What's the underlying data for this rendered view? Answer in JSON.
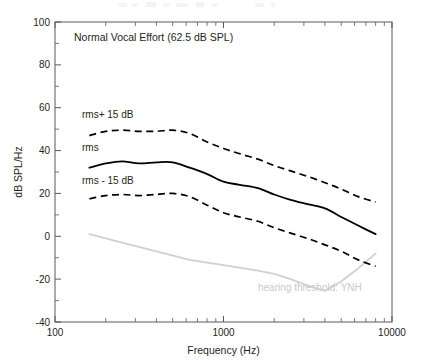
{
  "chart_data": {
    "type": "line",
    "title": "Normal Vocal Effort (62.5 dB SPL)",
    "xlabel": "Frequency (Hz)",
    "ylabel": "dB SPL/Hz",
    "xscale": "log",
    "xlim": [
      100,
      10000
    ],
    "ylim": [
      -40,
      100
    ],
    "xticks": [
      100,
      1000,
      10000
    ],
    "xtick_labels": [
      "100",
      "1000",
      "10000"
    ],
    "yticks": [
      -40,
      -20,
      0,
      20,
      40,
      60,
      80,
      100
    ],
    "ytick_labels": [
      "-40",
      "-20",
      "0",
      "20",
      "40",
      "60",
      "80",
      "100"
    ],
    "grid": false,
    "legend": "inline-annotations",
    "series": [
      {
        "name": "rms+ 15 dB",
        "label": "rms+ 15 dB",
        "style": "dashed",
        "color": "#000000",
        "x": [
          160,
          200,
          250,
          315,
          400,
          500,
          630,
          800,
          1000,
          1250,
          1600,
          2000,
          2500,
          3150,
          4000,
          5000,
          6300,
          8000
        ],
        "y": [
          47,
          49,
          49.5,
          49,
          49,
          49.5,
          48,
          44,
          41,
          38.5,
          36,
          33,
          30.5,
          28,
          25,
          22,
          18.5,
          16
        ]
      },
      {
        "name": "rms",
        "label": "rms",
        "style": "solid",
        "color": "#000000",
        "x": [
          160,
          200,
          250,
          315,
          400,
          500,
          630,
          800,
          1000,
          1250,
          1600,
          2000,
          2500,
          3150,
          4000,
          5000,
          6300,
          8000
        ],
        "y": [
          32,
          34,
          35,
          34,
          34.5,
          34.5,
          32,
          29,
          25.5,
          24,
          22.5,
          19.5,
          17,
          15,
          13,
          9,
          5,
          1
        ]
      },
      {
        "name": "rms - 15 dB",
        "label": "rms - 15 dB",
        "style": "dashed",
        "color": "#000000",
        "x": [
          160,
          200,
          250,
          315,
          400,
          500,
          630,
          800,
          1000,
          1250,
          1600,
          2000,
          2500,
          3150,
          4000,
          5000,
          6300,
          8000
        ],
        "y": [
          17.5,
          19,
          19.5,
          19,
          19.5,
          20,
          18.5,
          14.5,
          11,
          9,
          7,
          4,
          1.5,
          -1,
          -4,
          -7,
          -11,
          -14
        ]
      },
      {
        "name": "hearing threshold: YNH",
        "label": "hearing threshold: YNH",
        "style": "solid-gray",
        "color": "#d0d0d0",
        "x": [
          160,
          250,
          400,
          630,
          1000,
          1600,
          2000,
          2500,
          3150,
          4000,
          5000,
          6300,
          8000
        ],
        "y": [
          1,
          -3,
          -7,
          -11,
          -13.5,
          -16,
          -17.5,
          -20,
          -23,
          -25.5,
          -21,
          -15,
          -8
        ]
      }
    ],
    "annotations": [
      {
        "text": "Normal Vocal Effort (62.5 dB SPL)",
        "x_px": 74,
        "y_px": 41
      },
      {
        "text": "rms+ 15 dB",
        "x_px": 82,
        "y_px": 118
      },
      {
        "text": "rms",
        "x_px": 82,
        "y_px": 151
      },
      {
        "text": "rms - 15 dB",
        "x_px": 82,
        "y_px": 184
      },
      {
        "text": "hearing threshold: YNH",
        "x_px": 258,
        "y_px": 291
      }
    ]
  }
}
